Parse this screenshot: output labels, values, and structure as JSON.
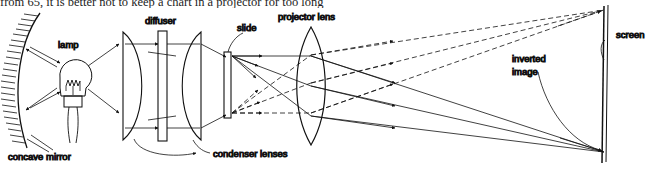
{
  "figure": {
    "caption_top": "from 65, it is better not to keep a chart in a projector for too long",
    "labels": {
      "concave_mirror": "concave mirror",
      "lamp": "lamp",
      "diffuser": "diffuser",
      "condenser_lenses": "condenser lenses",
      "slide": "slide",
      "projector_lens": "projector lens",
      "inverted_image_line1": "inverted",
      "inverted_image_line2": "image",
      "screen": "screen"
    },
    "colors": {
      "ink": "#111111",
      "background": "#ffffff",
      "ray_solid": "#222222",
      "ray_dashed": "#222222"
    },
    "optics": {
      "mirror_type": "concave",
      "condenser_count": 2,
      "projector_lens_type": "biconvex",
      "ray_bundles": [
        {
          "style": "dashed",
          "count": 3,
          "origin": "slide-bottom",
          "destination": "screen-top"
        },
        {
          "style": "solid",
          "count": 3,
          "origin": "slide-top",
          "destination": "screen-bottom"
        }
      ],
      "image_orientation": "inverted"
    }
  }
}
